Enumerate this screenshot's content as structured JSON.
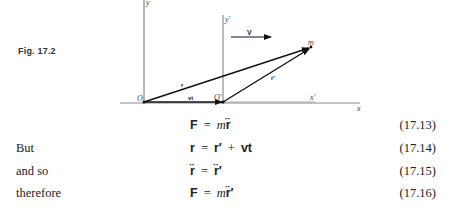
{
  "figure": {
    "label": "Fig. 17.2",
    "axes": {
      "y": "y",
      "y_prime": "y′",
      "x": "x",
      "x_prime": "x′"
    },
    "points": {
      "origin": "O",
      "origin_prime": "O′",
      "mass": "m"
    },
    "vectors": {
      "velocity": "V",
      "r": "r",
      "r_prime": "r′",
      "vt": "vt"
    }
  },
  "equations": [
    {
      "lead": "",
      "lhs": "F",
      "rhs_a": "m",
      "rhs_b": "r̈",
      "rhs_c": "",
      "number": "(17.13)"
    },
    {
      "lead": "But",
      "lhs": "r",
      "rhs_a": "r′",
      "rhs_b": "+",
      "rhs_c": "vt",
      "number": "(17.14)"
    },
    {
      "lead": "and so",
      "lhs": "r̈",
      "rhs_a": "r̈′",
      "rhs_b": "",
      "rhs_c": "",
      "number": "(17.15)"
    },
    {
      "lead": "therefore",
      "lhs": "F",
      "rhs_a": "m",
      "rhs_b": "r̈′",
      "rhs_c": "",
      "number": "(17.16)"
    }
  ],
  "equals": "="
}
